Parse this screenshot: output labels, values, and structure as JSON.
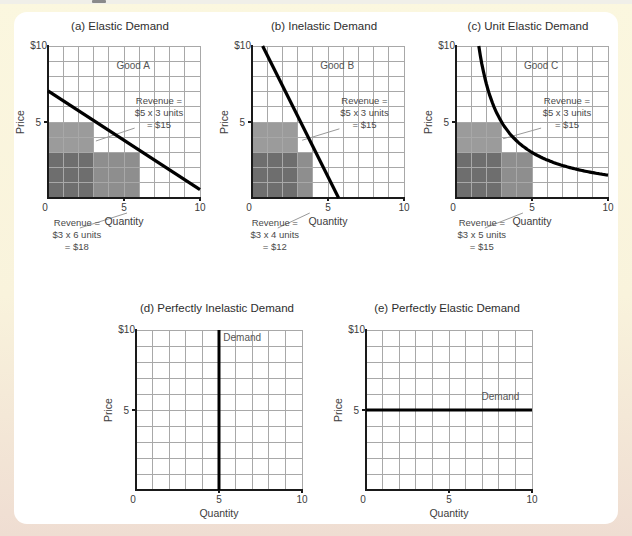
{
  "page": {
    "background_top": "#fbf7df",
    "background_bottom": "#efddd2",
    "figure_panel_bg": "#ffffff"
  },
  "style": {
    "revenue_high_fill": "#9b9b9b",
    "revenue_low_fill": "#8e8e8e",
    "revenue_overlap_fill": "#6e6e6e",
    "grid_color": "#a8a8a8",
    "axis_color": "#1a1a1a",
    "curve_color": "#000000",
    "leader_color": "#999999",
    "text_color": "#3c3c3c",
    "muted_text_color": "#555555",
    "annotation_color": "#4a4a4a"
  },
  "chart_data": [
    {
      "panel": "a",
      "row": "top",
      "type": "line",
      "title": "(a) Elastic Demand",
      "good_label": "Good A",
      "xlabel": "Quantity",
      "ylabel": "Price",
      "xlim": [
        0,
        10
      ],
      "ylim": [
        0,
        10
      ],
      "grid": true,
      "y_top_tick": "$10",
      "y_mid_tick": "5",
      "x_ticks": [
        "0",
        "5",
        "10"
      ],
      "demand": {
        "kind": "segment",
        "points": [
          [
            0,
            7.05
          ],
          [
            10,
            0.55
          ]
        ]
      },
      "revenue_high": {
        "price": 5,
        "quantity": 3,
        "revenue": 15,
        "lines": [
          "Revenue =",
          "$5 x 3 units",
          "= $15"
        ],
        "label_center": [
          7.3,
          6.2
        ],
        "leader": {
          "from": [
            5.7,
            4.6
          ],
          "to": [
            3.15,
            3.75
          ]
        }
      },
      "revenue_low": {
        "price": 3,
        "quantity": 6,
        "revenue": 18,
        "lines": [
          "Revenue =",
          "$3 x 6 units",
          "= $18"
        ],
        "label_center_x": 1.9,
        "leader_target_x": 5.2
      }
    },
    {
      "panel": "b",
      "row": "top",
      "type": "line",
      "title": "(b) Inelastic Demand",
      "good_label": "Good B",
      "xlabel": "Quantity",
      "ylabel": "Price",
      "xlim": [
        0,
        10
      ],
      "ylim": [
        0,
        10
      ],
      "grid": true,
      "y_top_tick": "$10",
      "y_mid_tick": "5",
      "x_ticks": [
        "0",
        "5",
        "10"
      ],
      "demand": {
        "kind": "segment",
        "points": [
          [
            0.7,
            10
          ],
          [
            5.7,
            0
          ]
        ]
      },
      "revenue_high": {
        "price": 5,
        "quantity": 3,
        "revenue": 15,
        "lines": [
          "Revenue =",
          "$5 x 3 units",
          "= $15"
        ],
        "label_center": [
          7.4,
          6.2
        ],
        "leader": {
          "from": [
            5.75,
            4.55
          ],
          "to": [
            3.3,
            3.8
          ]
        }
      },
      "revenue_low": {
        "price": 3,
        "quantity": 4,
        "revenue": 12,
        "lines": [
          "Revenue =",
          "$3 x 4 units",
          "= $12"
        ],
        "label_center_x": 1.5,
        "leader_target_x": 3.8
      }
    },
    {
      "panel": "c",
      "row": "top",
      "type": "line",
      "title": "(c) Unit Elastic Demand",
      "good_label": "Good C",
      "xlabel": "Quantity",
      "ylabel": "Price",
      "xlim": [
        0,
        10
      ],
      "ylim": [
        0,
        10
      ],
      "grid": true,
      "y_top_tick": "$10",
      "y_mid_tick": "5",
      "x_ticks": [
        "0",
        "5",
        "10"
      ],
      "demand": {
        "kind": "hyperbola",
        "k": 15,
        "x_range": [
          1.5,
          10
        ]
      },
      "revenue_high": {
        "price": 5,
        "quantity": 3,
        "revenue": 15,
        "lines": [
          "Revenue =",
          "$5 x 3 units",
          "= $15"
        ],
        "label_center": [
          7.3,
          6.2
        ],
        "leader": {
          "from": [
            5.6,
            4.6
          ],
          "to": [
            3.1,
            3.9
          ]
        }
      },
      "revenue_low": {
        "price": 3,
        "quantity": 5,
        "revenue": 15,
        "lines": [
          "Revenue =",
          "$3 x 5 units",
          "= $15"
        ],
        "label_center_x": 1.7,
        "leader_target_x": 4.4
      }
    },
    {
      "panel": "d",
      "row": "bottom",
      "type": "line",
      "title": "(d) Perfectly Inelastic Demand",
      "xlabel": "Quantity",
      "ylabel": "Price",
      "xlim": [
        0,
        10
      ],
      "ylim": [
        0,
        10
      ],
      "grid": true,
      "y_top_tick": "$10",
      "y_mid_tick": "5",
      "x_ticks": [
        "0",
        "5",
        "10"
      ],
      "demand": {
        "kind": "vertical",
        "x": 5
      },
      "demand_label": {
        "text": "Demand",
        "pos": [
          6.4,
          9.3
        ]
      }
    },
    {
      "panel": "e",
      "row": "bottom",
      "type": "line",
      "title": "(e) Perfectly Elastic Demand",
      "xlabel": "Quantity",
      "ylabel": "Price",
      "xlim": [
        0,
        10
      ],
      "ylim": [
        0,
        10
      ],
      "grid": true,
      "y_top_tick": "$10",
      "y_mid_tick": "5",
      "x_ticks": [
        "0",
        "5",
        "10"
      ],
      "demand": {
        "kind": "horizontal",
        "y": 5
      },
      "demand_label": {
        "text": "Demand",
        "pos": [
          8.1,
          5.65
        ]
      }
    }
  ]
}
